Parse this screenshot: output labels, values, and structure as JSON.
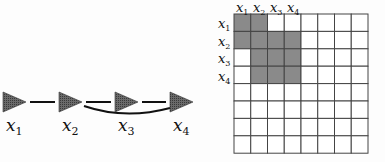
{
  "chain": {
    "nodes": [
      {
        "label": "x",
        "sub": "1"
      },
      {
        "label": "x",
        "sub": "2"
      },
      {
        "label": "x",
        "sub": "3"
      },
      {
        "label": "x",
        "sub": "4"
      }
    ],
    "edges": [
      {
        "from": 1,
        "to": 2,
        "shape": "straight"
      },
      {
        "from": 2,
        "to": 3,
        "shape": "straight"
      },
      {
        "from": 3,
        "to": 4,
        "shape": "straight"
      },
      {
        "from": 2,
        "to": 4,
        "shape": "curved"
      }
    ]
  },
  "matrix": {
    "size": 8,
    "col_labels": [
      {
        "label": "x",
        "sub": "1"
      },
      {
        "label": "x",
        "sub": "2"
      },
      {
        "label": "x",
        "sub": "3"
      },
      {
        "label": "x",
        "sub": "4"
      }
    ],
    "row_labels": [
      {
        "label": "x",
        "sub": "1"
      },
      {
        "label": "x",
        "sub": "2"
      },
      {
        "label": "x",
        "sub": "3"
      },
      {
        "label": "x",
        "sub": "4"
      }
    ],
    "shaded_cells": [
      [
        0,
        0
      ],
      [
        0,
        1
      ],
      [
        1,
        0
      ],
      [
        1,
        1
      ],
      [
        1,
        2
      ],
      [
        1,
        3
      ],
      [
        2,
        1
      ],
      [
        2,
        2
      ],
      [
        2,
        3
      ],
      [
        3,
        1
      ],
      [
        3,
        2
      ],
      [
        3,
        3
      ]
    ],
    "shade_color": "#8a8a8a",
    "grid_color": "#444444"
  }
}
